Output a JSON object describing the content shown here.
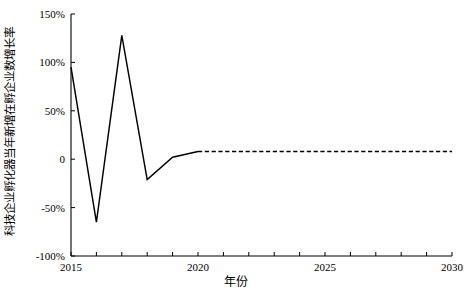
{
  "chart_data": {
    "type": "line",
    "title": "",
    "xlabel": "年份",
    "ylabel": "科技企业孵化器当年新增在孵企业数增长率",
    "x": [
      2015,
      2016,
      2017,
      2018,
      2019,
      2020,
      2021,
      2022,
      2023,
      2024,
      2025,
      2026,
      2027,
      2028,
      2029,
      2030
    ],
    "series": [
      {
        "name": "historical",
        "style": "solid",
        "x": [
          2015,
          2016,
          2017,
          2018,
          2019,
          2020
        ],
        "values": [
          95,
          -65,
          128,
          -21,
          2,
          8
        ]
      },
      {
        "name": "forecast",
        "style": "dashed",
        "x": [
          2020,
          2021,
          2022,
          2023,
          2024,
          2025,
          2026,
          2027,
          2028,
          2029,
          2030
        ],
        "values": [
          8,
          8,
          8,
          8,
          8,
          8,
          8,
          8,
          8,
          8,
          8
        ]
      }
    ],
    "xlim": [
      2015,
      2030
    ],
    "ylim": [
      -100,
      150
    ],
    "yticks": [
      150,
      100,
      50,
      0,
      -50,
      -100
    ],
    "ytick_labels": [
      "150%",
      "100%",
      "50%",
      "0",
      "-50%",
      "-100%"
    ],
    "xticks": [
      2015,
      2016,
      2017,
      2018,
      2019,
      2020,
      2021,
      2022,
      2023,
      2024,
      2025,
      2026,
      2027,
      2028,
      2029,
      2030
    ],
    "xtick_labels_shown": [
      "2015",
      "2020",
      "2025",
      "2030"
    ],
    "xtick_labels_shown_values": [
      2015,
      2020,
      2025,
      2030
    ],
    "grid": false,
    "legend": "none",
    "line_color": "#000000",
    "axis_color": "#000000",
    "background_color": "#ffffff"
  }
}
